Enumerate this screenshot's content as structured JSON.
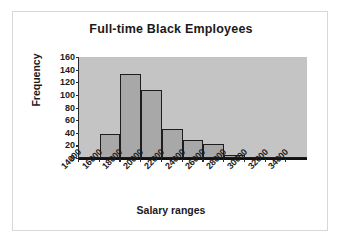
{
  "chart_data": {
    "type": "bar",
    "title": "Full-time Black Employees",
    "xlabel": "Salary ranges",
    "ylabel": "Frequency",
    "categories": [
      "14000",
      "16000",
      "18000",
      "20000",
      "22000",
      "24000",
      "26000",
      "28000",
      "30000",
      "32000",
      "34000"
    ],
    "values": [
      0,
      38,
      133,
      108,
      46,
      29,
      22,
      5,
      2,
      0,
      0
    ],
    "xtick_labels": [
      "14000",
      "16000",
      "18000",
      "20000",
      "22000",
      "24000",
      "26000",
      "28000",
      "30000",
      "32000",
      "34000"
    ],
    "ytick_labels": [
      "160",
      "140",
      "120",
      "100",
      "80",
      "60",
      "40",
      "20",
      "0"
    ],
    "ytick_values": [
      160,
      140,
      120,
      100,
      80,
      60,
      40,
      20,
      0
    ],
    "ylim": [
      0,
      160
    ],
    "grid": false,
    "legend": false,
    "bar_color": "#a8a8a8",
    "bar_border_color": "#1d1d1d",
    "plot_background": "#c4c4c4",
    "axis_color": "#1d1d1d",
    "text_color": "#1a1a1a"
  }
}
